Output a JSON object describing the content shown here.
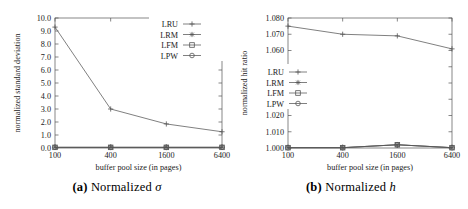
{
  "figure": {
    "panels": [
      {
        "id": "a",
        "caption_tag": "(a)",
        "caption_text": "Normalized",
        "caption_symbol": "σ",
        "chart_data": {
          "type": "line",
          "title": "",
          "xlabel": "buffer pool size (in pages)",
          "ylabel": "normalized standard deviation",
          "categories": [
            "100",
            "400",
            "1600",
            "6400"
          ],
          "x": [
            100,
            400,
            1600,
            6400
          ],
          "xtick_labels": [
            "100",
            "400",
            "1600",
            "6400"
          ],
          "ytick_labels": [
            "0.0",
            "1.0",
            "2.0",
            "3.0",
            "4.0",
            "5.0",
            "6.0",
            "7.0",
            "8.0",
            "9.0",
            "10.0"
          ],
          "ylim": [
            0.0,
            10.0
          ],
          "ytick_step": 1.0,
          "grid": false,
          "legend_position": "top-right",
          "series": [
            {
              "name": "LRU",
              "marker": "plus",
              "values": [
                9.3,
                3.0,
                1.85,
                1.25
              ]
            },
            {
              "name": "LRM",
              "marker": "star",
              "values": [
                0.05,
                0.05,
                0.05,
                0.05
              ]
            },
            {
              "name": "LFM",
              "marker": "square",
              "values": [
                0.05,
                0.05,
                0.05,
                0.05
              ]
            },
            {
              "name": "LPW",
              "marker": "circle",
              "values": [
                0.05,
                0.05,
                0.05,
                0.05
              ]
            }
          ]
        }
      },
      {
        "id": "b",
        "caption_tag": "(b)",
        "caption_text": "Normalized",
        "caption_symbol": "h",
        "chart_data": {
          "type": "line",
          "title": "",
          "xlabel": "buffer pool size (in pages)",
          "ylabel": "normalized hit ratio",
          "categories": [
            "100",
            "400",
            "1600",
            "6400"
          ],
          "x": [
            100,
            400,
            1600,
            6400
          ],
          "xtick_labels": [
            "100",
            "400",
            "1600",
            "6400"
          ],
          "ytick_labels": [
            "1.000",
            "1.010",
            "1.020",
            "1.030",
            "1.040",
            "1.050",
            "1.060",
            "1.070",
            "1.080"
          ],
          "ylim": [
            1.0,
            1.08
          ],
          "ytick_step": 0.01,
          "grid": false,
          "legend_position": "middle-left",
          "series": [
            {
              "name": "LRU",
              "marker": "plus",
              "values": [
                1.075,
                1.07,
                1.069,
                1.061
              ]
            },
            {
              "name": "LRM",
              "marker": "star",
              "values": [
                1.0002,
                1.0002,
                1.002,
                1.0002
              ]
            },
            {
              "name": "LFM",
              "marker": "square",
              "values": [
                1.0002,
                1.0002,
                1.002,
                1.0002
              ]
            },
            {
              "name": "LPW",
              "marker": "circle",
              "values": [
                1.0002,
                1.0002,
                1.002,
                1.0002
              ]
            }
          ]
        }
      }
    ],
    "colors": {
      "line": "#555555",
      "axis": "#555555",
      "text": "#1a1a1a",
      "background": "#ffffff"
    }
  }
}
